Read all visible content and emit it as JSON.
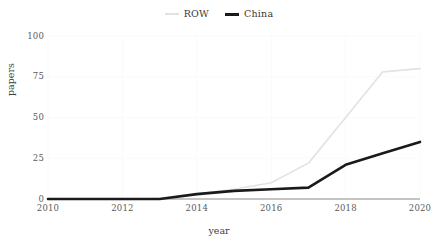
{
  "chart_data": {
    "type": "line",
    "title": "",
    "xlabel": "year",
    "ylabel": "papers",
    "x": [
      2010,
      2011,
      2012,
      2013,
      2014,
      2015,
      2016,
      2017,
      2018,
      2019,
      2020
    ],
    "xlim": [
      2010,
      2020
    ],
    "ylim": [
      0,
      100
    ],
    "xticks": [
      2010,
      2012,
      2014,
      2016,
      2018,
      2020
    ],
    "xtick_labels": [
      "2010",
      "2012",
      "2014",
      "2016",
      "2018",
      "2020"
    ],
    "yticks": [
      0,
      25,
      50,
      75,
      100
    ],
    "ytick_labels": [
      "0",
      "25",
      "50",
      "75",
      "100"
    ],
    "grid": true,
    "legend_position": "top-center",
    "series": [
      {
        "name": "ROW",
        "color": "#e2e2e2",
        "values": [
          0,
          0,
          0,
          0,
          3,
          6,
          10,
          22,
          50,
          78,
          80
        ]
      },
      {
        "name": "China",
        "color": "#1a1a1a",
        "values": [
          0,
          0,
          0,
          0,
          3,
          5,
          6,
          7,
          21,
          28,
          35
        ]
      }
    ]
  },
  "legend": {
    "entries": [
      {
        "label": "ROW",
        "color": "#e2e2e2"
      },
      {
        "label": "China",
        "color": "#1a1a1a"
      }
    ]
  },
  "axes": {
    "x_label": "year",
    "y_label": "papers",
    "x_tick_labels": [
      "2010",
      "2012",
      "2014",
      "2016",
      "2018",
      "2020"
    ],
    "y_tick_labels": [
      "0",
      "25",
      "50",
      "75",
      "100"
    ]
  },
  "colors": {
    "background": "#ffffff",
    "gridline": "#fafafa",
    "axis": "#b0b0b0",
    "text": "#4d4d4d",
    "row_series": "#e2e2e2",
    "china_series": "#1a1a1a"
  }
}
